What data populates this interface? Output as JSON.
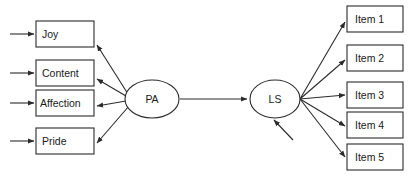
{
  "diagram": {
    "type": "path-diagram",
    "background_color": "#ffffff",
    "stroke_color": "#2b2b2b",
    "text_color": "#1a1a1a",
    "latent_variables": [
      {
        "id": "PA",
        "label": "PA",
        "shape": "ellipse",
        "cx": 152,
        "cy": 99,
        "rx": 27,
        "ry": 19
      },
      {
        "id": "LS",
        "label": "LS",
        "shape": "ellipse",
        "cx": 275,
        "cy": 99,
        "rx": 25,
        "ry": 19
      }
    ],
    "indicators_left": [
      {
        "id": "joy",
        "label": "Joy",
        "x": 36,
        "y": 21,
        "width": 58,
        "height": 26
      },
      {
        "id": "content",
        "label": "Content",
        "x": 36,
        "y": 60,
        "width": 58,
        "height": 26
      },
      {
        "id": "affection",
        "label": "Affection",
        "x": 36,
        "y": 90,
        "width": 58,
        "height": 26
      },
      {
        "id": "pride",
        "label": "Pride",
        "x": 36,
        "y": 128,
        "width": 58,
        "height": 26
      }
    ],
    "indicators_right": [
      {
        "id": "item-1",
        "label": "Item 1",
        "x": 347,
        "y": 6,
        "width": 56,
        "height": 26
      },
      {
        "id": "item-2",
        "label": "Item 2",
        "x": 347,
        "y": 45,
        "width": 56,
        "height": 26
      },
      {
        "id": "item-3",
        "label": "Item 3",
        "x": 347,
        "y": 82,
        "width": 56,
        "height": 26
      },
      {
        "id": "item-4",
        "label": "Item 4",
        "x": 347,
        "y": 112,
        "width": 56,
        "height": 26
      },
      {
        "id": "item-5",
        "label": "Item 5",
        "x": 347,
        "y": 144,
        "width": 56,
        "height": 26
      }
    ],
    "structural_path": {
      "from": "PA",
      "to": "LS",
      "direction": "left-to-right"
    },
    "error_arrows_left": [
      {
        "target": "joy",
        "from_x": 10,
        "y": 34
      },
      {
        "target": "content",
        "from_x": 10,
        "y": 73
      },
      {
        "target": "affection",
        "from_x": 10,
        "y": 103
      },
      {
        "target": "pride",
        "from_x": 10,
        "y": 141
      }
    ],
    "disturbance_arrow": {
      "target": "LS",
      "from_x": 293,
      "from_y": 140,
      "to_x": 272,
      "to_y": 118
    }
  }
}
